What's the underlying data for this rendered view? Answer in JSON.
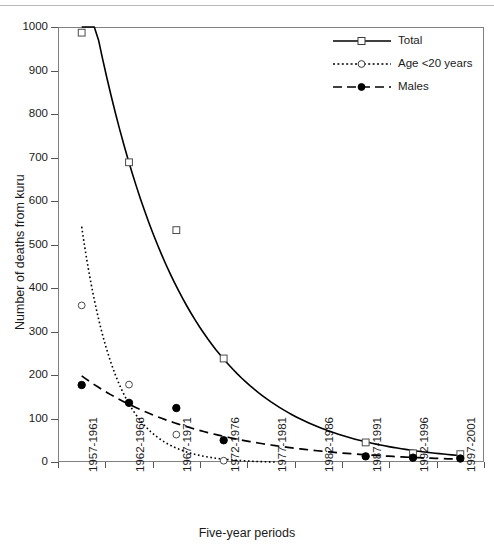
{
  "chart_data": {
    "type": "line",
    "title": "",
    "xlabel": "Five-year periods",
    "ylabel": "Number of deaths from kuru",
    "categories": [
      "1957-1961",
      "1962-1966",
      "1967-1971",
      "1972-1976",
      "1977-1981",
      "1982-1986",
      "1987-1991",
      "1992-1996",
      "1997-2001"
    ],
    "ylim": [
      0,
      1000
    ],
    "yticks": [
      0,
      100,
      200,
      300,
      400,
      500,
      600,
      700,
      800,
      900,
      1000
    ],
    "ytick_labels": [
      "0",
      "100",
      "200",
      "300",
      "400",
      "500",
      "600",
      "700",
      "800",
      "900",
      "1000"
    ],
    "grid": false,
    "legend_position": "top-right",
    "series": [
      {
        "name": "Total",
        "marker": "open-square",
        "line_style": "solid",
        "color": "#000000",
        "values": [
          987,
          689,
          533,
          238,
          null,
          null,
          45,
          20,
          18
        ]
      },
      {
        "name": "Age <20 years",
        "marker": "open-circle",
        "line_style": "dotted",
        "color": "#000000",
        "values": [
          360,
          178,
          63,
          3,
          null,
          null,
          null,
          null,
          null
        ]
      },
      {
        "name": "Males",
        "marker": "filled-circle",
        "line_style": "dashed",
        "color": "#000000",
        "values": [
          177,
          136,
          124,
          50,
          null,
          null,
          13,
          10,
          8
        ]
      }
    ]
  },
  "axes": {
    "y_title": "Number of deaths from kuru",
    "x_title": "Five-year periods"
  },
  "legend": {
    "items": [
      {
        "label": "Total",
        "key": "solid-open-square-key"
      },
      {
        "label": "Age <20 years",
        "key": "dotted-open-circle-key"
      },
      {
        "label": "Males",
        "key": "dashed-filled-circle-key"
      }
    ]
  }
}
